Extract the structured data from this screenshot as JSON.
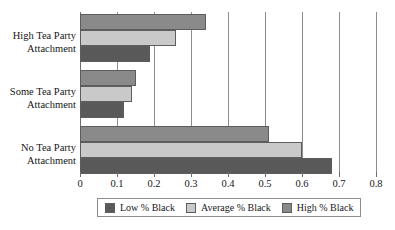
{
  "chart_data": {
    "type": "bar",
    "orientation": "horizontal",
    "title": "",
    "xlabel": "",
    "ylabel": "",
    "xlim": [
      0,
      0.8
    ],
    "xticks": [
      "0",
      "0.1",
      "0.2",
      "0.3",
      "0.4",
      "0.5",
      "0.6",
      "0.7",
      "0.8"
    ],
    "xtick_values": [
      0,
      0.1,
      0.2,
      0.3,
      0.4,
      0.5,
      0.6,
      0.7,
      0.8
    ],
    "grid": true,
    "grid_axis": "x",
    "legend_position": "bottom",
    "categories": [
      "High Tea Party\nAttachment",
      "Some Tea Party\nAttachment",
      "No Tea Party\nAttachment"
    ],
    "series": [
      {
        "name": "Low % Black",
        "color": "#595959",
        "values": [
          0.19,
          0.12,
          0.68
        ]
      },
      {
        "name": "Average % Black",
        "color": "#c9c9c9",
        "values": [
          0.26,
          0.14,
          0.6
        ]
      },
      {
        "name": "High % Black",
        "color": "#8a8a8a",
        "values": [
          0.34,
          0.15,
          0.51
        ]
      }
    ]
  },
  "legend": {
    "items": [
      {
        "label": "Low % Black",
        "swatch": "legend-swatch-low"
      },
      {
        "label": "Average % Black",
        "swatch": "legend-swatch-average"
      },
      {
        "label": "High % Black",
        "swatch": "legend-swatch-high"
      }
    ]
  },
  "colors": {
    "low": "#595959",
    "average": "#c9c9c9",
    "high": "#8a8a8a",
    "grid": "#8d8d8d",
    "text": "#171717",
    "background": "#ffffff"
  }
}
